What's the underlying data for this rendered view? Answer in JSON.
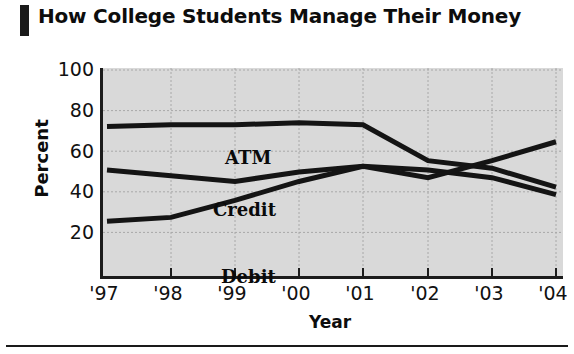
{
  "title": "How College Students Manage Their Money",
  "chart_data": {
    "type": "line",
    "title": "How College Students Manage Their Money",
    "xlabel": "Year",
    "ylabel": "Percent",
    "categories": [
      "'97",
      "'98",
      "'99",
      "'00",
      "'01",
      "'02",
      "'03",
      "'04"
    ],
    "x": [
      1997,
      1998,
      1999,
      2000,
      2001,
      2002,
      2003,
      2004
    ],
    "series": [
      {
        "name": "ATM",
        "values": [
          79,
          80,
          80,
          81,
          80,
          61,
          57,
          47
        ]
      },
      {
        "name": "Credit",
        "values": [
          56,
          53,
          50,
          55,
          58,
          56,
          52,
          43
        ]
      },
      {
        "name": "Debit",
        "values": [
          29,
          31,
          40,
          50,
          58,
          52,
          61,
          71
        ]
      }
    ],
    "ylim": [
      0,
      110
    ],
    "yticks": [
      20,
      40,
      60,
      80,
      100
    ],
    "ytick_labels": [
      "20",
      "40",
      "60",
      "80",
      "100"
    ],
    "grid": true,
    "legend": "inline-labels",
    "plot_background": "#d9d9d9",
    "line_color": "#141414",
    "axis_color": "#1c1c1c",
    "gridline_color": "#a8a8a8"
  },
  "axis": {
    "y_title": "Percent",
    "x_title": "Year"
  }
}
